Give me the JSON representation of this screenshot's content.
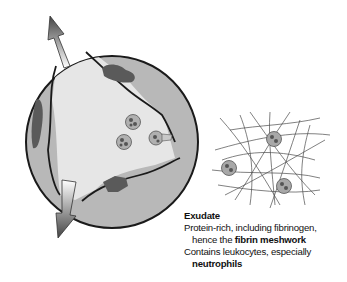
{
  "diagram": {
    "type": "illustration",
    "colors": {
      "vessel_wall": "#b8b8b8",
      "lumen": "#e6e6e6",
      "nucleus": "#5a5a5a",
      "outline": "#1a1a1a",
      "fibrin": "#4a4a4a",
      "cell": "#a8a8a8"
    },
    "labels": {
      "title": "Exudate",
      "line1": "Protein-rich, including fibrinogen,",
      "line2_prefix": "hence the ",
      "line2_bold": "fibrin meshwork",
      "line3": "Contains leukocytes, especially",
      "line4_bold": "neutrophils"
    },
    "arrows": [
      {
        "direction": "up-left",
        "meaning": "outflow"
      },
      {
        "direction": "down-left",
        "meaning": "outflow"
      }
    ]
  }
}
